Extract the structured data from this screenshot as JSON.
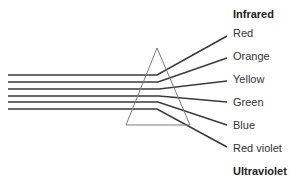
{
  "diagram": {
    "colors": {
      "ray": "#3a3a3a",
      "prism": "#7a7a7a",
      "text": "#333333"
    },
    "prism": {
      "apex": [
        157,
        48
      ],
      "base_left": [
        126,
        125
      ],
      "base_right": [
        190,
        125
      ]
    },
    "header_label": "Infrared",
    "footer_label": "Ultraviolet",
    "rays": [
      {
        "label": "Red",
        "y_in": 75,
        "bend": [
          157,
          75
        ],
        "end": [
          227,
          36
        ],
        "label_y": 27
      },
      {
        "label": "Orange",
        "y_in": 82,
        "bend": [
          158,
          82
        ],
        "end": [
          227,
          58
        ],
        "label_y": 50
      },
      {
        "label": "Yellow",
        "y_in": 89,
        "bend": [
          159,
          89
        ],
        "end": [
          227,
          81
        ],
        "label_y": 73
      },
      {
        "label": "Green",
        "y_in": 96,
        "bend": [
          159,
          96
        ],
        "end": [
          227,
          102
        ],
        "label_y": 96
      },
      {
        "label": "Blue",
        "y_in": 102,
        "bend": [
          158,
          102
        ],
        "end": [
          227,
          125
        ],
        "label_y": 119
      },
      {
        "label": "Red violet",
        "y_in": 109,
        "bend": [
          157,
          109
        ],
        "end": [
          227,
          147
        ],
        "label_y": 142
      }
    ],
    "rays_start_x": 8
  }
}
